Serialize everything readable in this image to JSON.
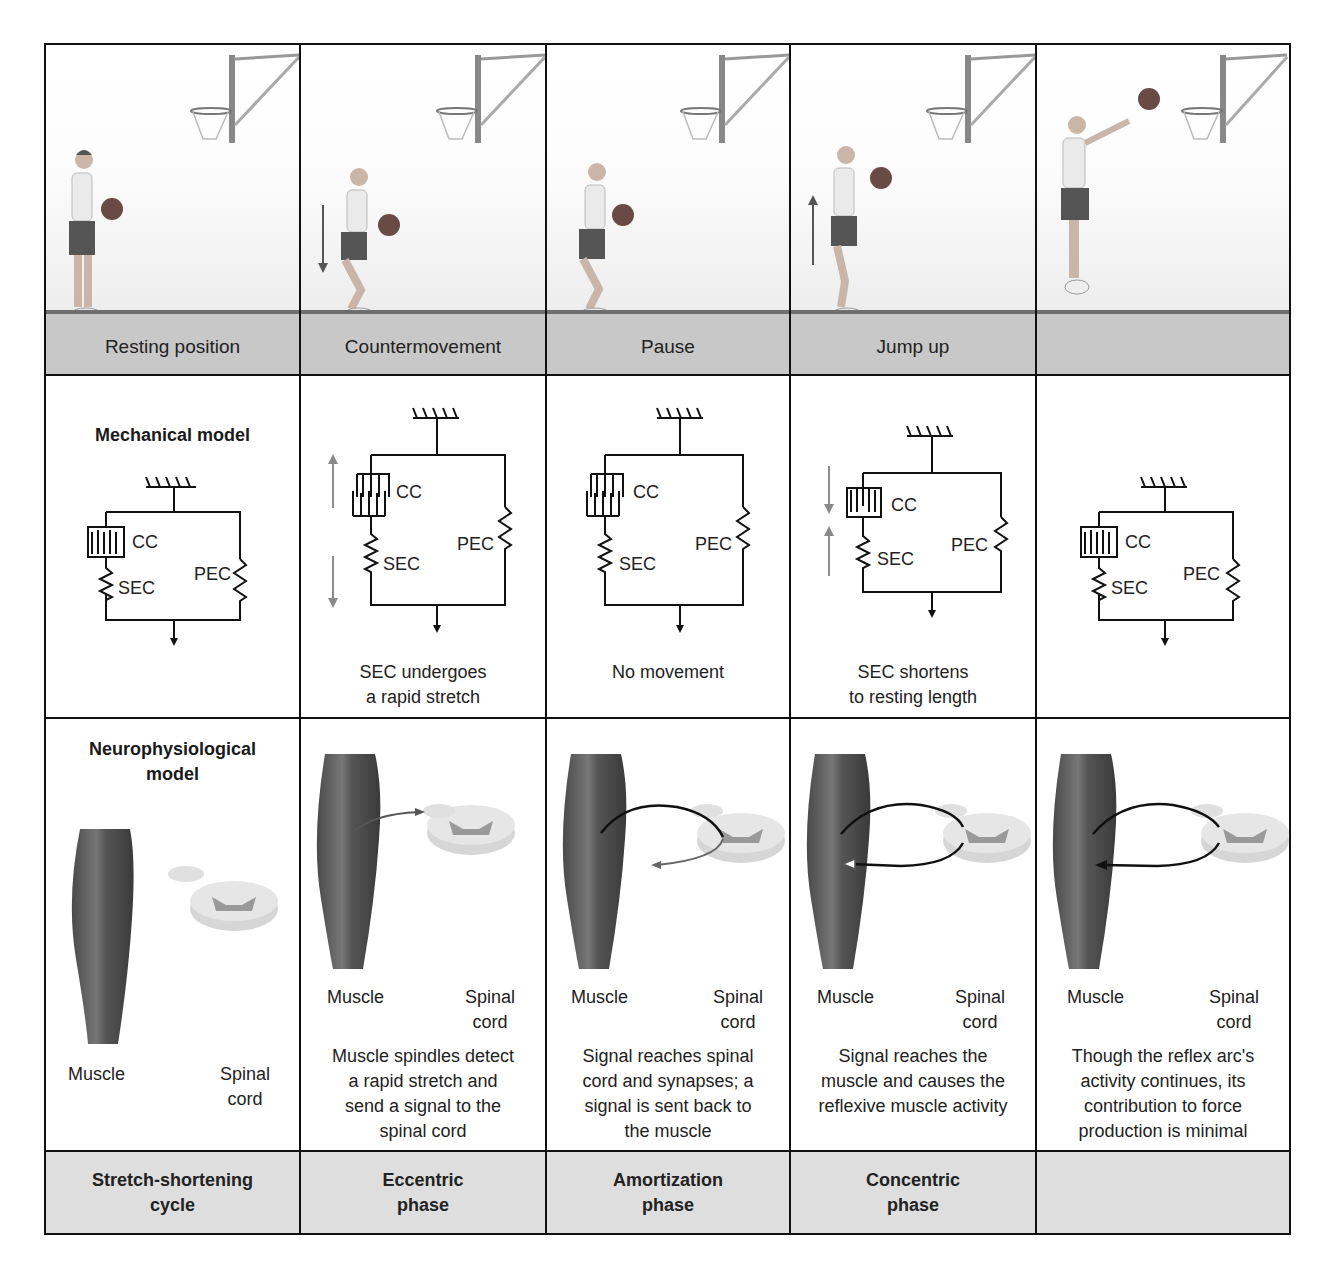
{
  "columns": [
    {
      "id": "resting",
      "stage_label": "Resting position",
      "mechanical": {
        "row_title": "Mechanical model",
        "cc": "CC",
        "sec": "SEC",
        "pec": "PEC",
        "caption_lines": []
      },
      "neuro": {
        "row_title_lines": [
          "Neurophysiological",
          "model"
        ],
        "muscle": "Muscle",
        "spinal_lines": [
          "Spinal",
          "cord"
        ],
        "caption_lines": []
      },
      "phase_lines": [
        "Stretch-shortening",
        "cycle"
      ]
    },
    {
      "id": "countermovement",
      "stage_label": "Countermovement",
      "mechanical": {
        "cc": "CC",
        "sec": "SEC",
        "pec": "PEC",
        "caption_lines": [
          "SEC undergoes",
          "a rapid stretch"
        ]
      },
      "neuro": {
        "muscle": "Muscle",
        "spinal_lines": [
          "Spinal",
          "cord"
        ],
        "caption_lines": [
          "Muscle spindles detect",
          "a rapid stretch and",
          "send a signal to the",
          "spinal cord"
        ]
      },
      "phase_lines": [
        "Eccentric",
        "phase"
      ]
    },
    {
      "id": "pause",
      "stage_label": "Pause",
      "mechanical": {
        "cc": "CC",
        "sec": "SEC",
        "pec": "PEC",
        "caption_lines": [
          "No movement"
        ]
      },
      "neuro": {
        "muscle": "Muscle",
        "spinal_lines": [
          "Spinal",
          "cord"
        ],
        "caption_lines": [
          "Signal reaches spinal",
          "cord and synapses; a",
          "signal is sent back to",
          "the muscle"
        ]
      },
      "phase_lines": [
        "Amortization",
        "phase"
      ]
    },
    {
      "id": "jump-up",
      "stage_label": "Jump up",
      "mechanical": {
        "cc": "CC",
        "sec": "SEC",
        "pec": "PEC",
        "caption_lines": [
          "SEC shortens",
          "to resting length"
        ]
      },
      "neuro": {
        "muscle": "Muscle",
        "spinal_lines": [
          "Spinal",
          "cord"
        ],
        "caption_lines": [
          "Signal reaches the",
          "muscle and causes the",
          "reflexive muscle activity"
        ]
      },
      "phase_lines": [
        "Concentric",
        "phase"
      ]
    },
    {
      "id": "release",
      "stage_label": "",
      "mechanical": {
        "cc": "CC",
        "sec": "SEC",
        "pec": "PEC",
        "caption_lines": []
      },
      "neuro": {
        "muscle": "Muscle",
        "spinal_lines": [
          "Spinal",
          "cord"
        ],
        "caption_lines": [
          "Though the reflex arc's",
          "activity continues, its",
          "contribution to force",
          "production is minimal"
        ]
      },
      "phase_lines": []
    }
  ],
  "colors": {
    "border": "#111111",
    "floor": "#c8c8c8",
    "phase_bg": "#dedede",
    "arrow_gray": "#8a8a8a",
    "muscle": "#5a5a5a"
  }
}
